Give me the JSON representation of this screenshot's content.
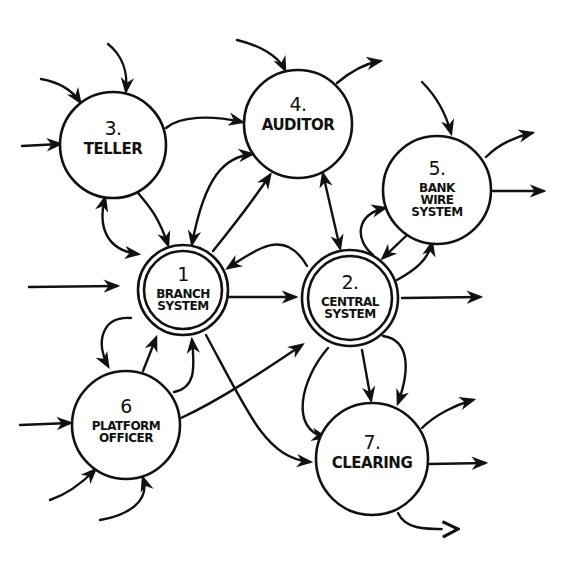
{
  "diagram": {
    "type": "data-flow-diagram",
    "style": "hand-drawn",
    "colors": {
      "ink": "#111111",
      "paper": "#ffffff"
    },
    "nodes": [
      {
        "id": "1",
        "number": "1",
        "lines": [
          "BRANCH",
          "SYSTEM"
        ],
        "label": "Branch System",
        "double_border": true,
        "cx": 183,
        "cy": 290,
        "r": 45
      },
      {
        "id": "2",
        "number": "2.",
        "lines": [
          "CENTRAL",
          "SYSTEM"
        ],
        "label": "Central System",
        "double_border": true,
        "cx": 350,
        "cy": 298,
        "r": 48
      },
      {
        "id": "3",
        "number": "3.",
        "lines": [
          "TELLER"
        ],
        "label": "Teller",
        "double_border": false,
        "cx": 113,
        "cy": 145,
        "r": 53
      },
      {
        "id": "4",
        "number": "4.",
        "lines": [
          "AUDITOR"
        ],
        "label": "Auditor",
        "double_border": false,
        "cx": 298,
        "cy": 124,
        "r": 54
      },
      {
        "id": "5",
        "number": "5.",
        "lines": [
          "BANK",
          "WIRE",
          "SYSTEM"
        ],
        "label": "Bank Wire System",
        "double_border": false,
        "cx": 437,
        "cy": 190,
        "r": 54
      },
      {
        "id": "6",
        "number": "6",
        "lines": [
          "PLATFORM",
          "OFFICER"
        ],
        "label": "Platform Officer",
        "double_border": false,
        "cx": 126,
        "cy": 425,
        "r": 54
      },
      {
        "id": "7",
        "number": "7.",
        "lines": [
          "CLEARING"
        ],
        "label": "Clearing",
        "double_border": false,
        "cx": 372,
        "cy": 459,
        "r": 56
      }
    ],
    "edges": [
      {
        "from": "external",
        "to": "3",
        "desc": "inflow from top-left"
      },
      {
        "from": "external",
        "to": "3",
        "desc": "inflow from top"
      },
      {
        "from": "external",
        "to": "3",
        "desc": "inflow from left"
      },
      {
        "from": "3",
        "to": "4",
        "desc": "Teller to Auditor"
      },
      {
        "from": "3",
        "to": "1",
        "desc": "Teller to Branch System"
      },
      {
        "from": "1",
        "to": "3",
        "desc": "Branch System to Teller (bidirectional loop)"
      },
      {
        "from": "external",
        "to": "4",
        "desc": "inflow from top-left"
      },
      {
        "from": "4",
        "to": "external",
        "desc": "outflow to top-right"
      },
      {
        "from": "1",
        "to": "4",
        "desc": "Branch System to Auditor"
      },
      {
        "from": "4",
        "to": "1",
        "desc": "Auditor to Branch System (curved)"
      },
      {
        "from": "4",
        "to": "2",
        "desc": "Auditor to Central System (bidirectional)"
      },
      {
        "from": "external",
        "to": "5",
        "desc": "inflow from top"
      },
      {
        "from": "5",
        "to": "external",
        "desc": "outflow to top-right"
      },
      {
        "from": "5",
        "to": "external",
        "desc": "outflow to right"
      },
      {
        "from": "2",
        "to": "5",
        "desc": "Central System to Bank Wire (loop)"
      },
      {
        "from": "5",
        "to": "2",
        "desc": "Bank Wire to Central System"
      },
      {
        "from": "external",
        "to": "1",
        "desc": "inflow from left"
      },
      {
        "from": "1",
        "to": "2",
        "desc": "Branch System to Central System"
      },
      {
        "from": "2",
        "to": "1",
        "desc": "Central System to Branch System (curved)"
      },
      {
        "from": "2",
        "to": "external",
        "desc": "outflow to right"
      },
      {
        "from": "1",
        "to": "6",
        "desc": "Branch System to Platform Officer (loop)"
      },
      {
        "from": "6",
        "to": "1",
        "desc": "Platform Officer to Branch System"
      },
      {
        "from": "6",
        "to": "1",
        "desc": "Platform Officer to Branch System (loop)"
      },
      {
        "from": "1",
        "to": "7",
        "desc": "Branch System to Clearing"
      },
      {
        "from": "6",
        "to": "2",
        "desc": "Platform Officer to Central System"
      },
      {
        "from": "external",
        "to": "6",
        "desc": "inflow from left"
      },
      {
        "from": "external",
        "to": "6",
        "desc": "inflow from bottom-left"
      },
      {
        "from": "external",
        "to": "6",
        "desc": "inflow from bottom"
      },
      {
        "from": "2",
        "to": "7",
        "desc": "Central System to Clearing (curved left)"
      },
      {
        "from": "2",
        "to": "7",
        "desc": "Central System to Clearing (straight)"
      },
      {
        "from": "2",
        "to": "7",
        "desc": "Central System to Clearing (right)"
      },
      {
        "from": "7",
        "to": "external",
        "desc": "outflow to top-right"
      },
      {
        "from": "7",
        "to": "external",
        "desc": "outflow to right"
      },
      {
        "from": "7",
        "to": "external",
        "desc": "outflow to bottom-right"
      }
    ]
  }
}
